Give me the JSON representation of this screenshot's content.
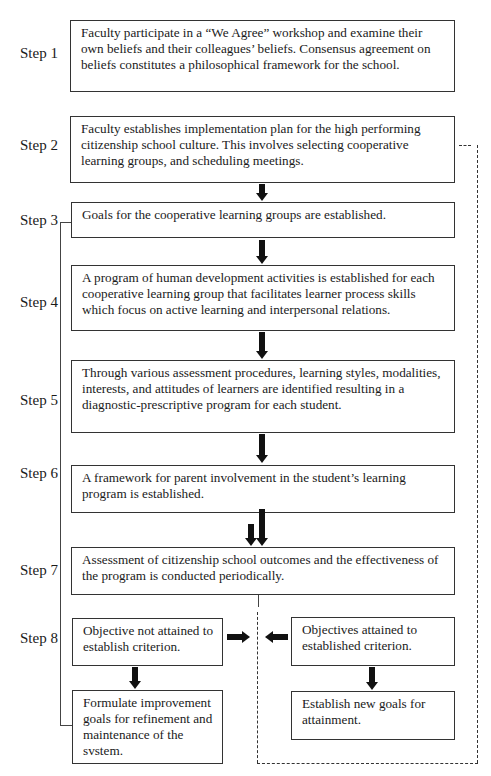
{
  "diagram": {
    "steps": [
      {
        "label": "Step 1",
        "text": "Faculty participate in a “We Agree” workshop and examine their own beliefs and their colleagues’ beliefs. Consensus agreement on beliefs constitutes a philosophical framework for the school."
      },
      {
        "label": "Step 2",
        "text": "Faculty establishes implementation plan for the high performing citizenship school culture. This involves selecting cooperative learning groups, and scheduling meetings."
      },
      {
        "label": "Step 3",
        "text": "Goals for the cooperative learning groups are established."
      },
      {
        "label": "Step 4",
        "text": "A program of human development activities is established for each cooperative learning group that facilitates learner process skills which focus on active learning and interpersonal relations."
      },
      {
        "label": "Step 5",
        "text": "Through various assessment procedures, learning styles, modalities, interests, and attitudes of learners are identified resulting in a diagnostic-prescriptive program for each student."
      },
      {
        "label": "Step 6",
        "text": "A framework for parent involvement in the student’s learning program is established."
      },
      {
        "label": "Step 7",
        "text": "Assessment of citizenship school outcomes and the effectiveness of the program is conducted periodically."
      },
      {
        "label": "Step 8"
      }
    ],
    "outcomes": {
      "not_attained": "Objective not attained to establish criterion.",
      "improvement": "Formulate improvement goals for refinement and maintenance of the svstem.",
      "attained": "Objectives attained to established criterion.",
      "new_goals": "Establish new goals for attainment."
    }
  }
}
